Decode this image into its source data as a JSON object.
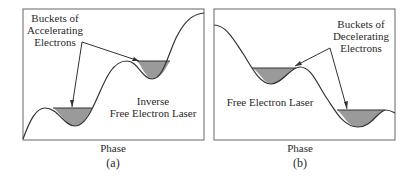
{
  "panels": [
    {
      "id": "a",
      "annotation_lines": [
        "Buckets of",
        "Accelerating",
        "Electrons"
      ],
      "mode_lines": [
        "Inverse",
        "Free Electron Laser"
      ],
      "xlabel": "Phase",
      "caption": "(a)"
    },
    {
      "id": "b",
      "annotation_lines": [
        "Buckets of",
        "Decelerating",
        "Electrons"
      ],
      "mode_lines": [
        "Free Electron Laser"
      ],
      "xlabel": "Phase",
      "caption": "(b)"
    }
  ],
  "colors": {
    "line": "#333333",
    "bucket_fill": "#9a9a9a",
    "frame": "#555555"
  }
}
